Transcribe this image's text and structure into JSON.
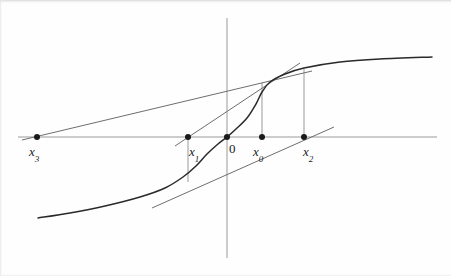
{
  "figure": {
    "background_color": "#fefefe",
    "curve_color": "#2a2a2a",
    "axis_color": "#9a9a9a",
    "tangent_color": "#6e6e6e",
    "point_color": "#1a1a1a"
  },
  "chart_data": {
    "type": "line",
    "title": "",
    "xlabel": "",
    "ylabel": "",
    "grid": false,
    "legend": null,
    "axes": {
      "origin_px": {
        "x": 227,
        "y": 137
      },
      "x_axis_px": {
        "x1": 18,
        "y1": 137,
        "x2": 437,
        "y2": 137
      },
      "y_axis_px": {
        "x1": 227,
        "y1": 18,
        "x2": 227,
        "y2": 258
      }
    },
    "curve": {
      "name": "f(x)",
      "description": "odd sigmoid-shaped function through the origin, flattening at both ends",
      "points_px": [
        {
          "x": 38,
          "y": 218
        },
        {
          "x": 70,
          "y": 213
        },
        {
          "x": 105,
          "y": 206
        },
        {
          "x": 140,
          "y": 197
        },
        {
          "x": 165,
          "y": 188
        },
        {
          "x": 183,
          "y": 177
        },
        {
          "x": 196,
          "y": 166
        },
        {
          "x": 207,
          "y": 154
        },
        {
          "x": 218,
          "y": 144
        },
        {
          "x": 227,
          "y": 137
        },
        {
          "x": 236,
          "y": 129
        },
        {
          "x": 247,
          "y": 118
        },
        {
          "x": 256,
          "y": 104
        },
        {
          "x": 262,
          "y": 92
        },
        {
          "x": 270,
          "y": 82
        },
        {
          "x": 285,
          "y": 74
        },
        {
          "x": 304,
          "y": 68
        },
        {
          "x": 340,
          "y": 62
        },
        {
          "x": 380,
          "y": 59
        },
        {
          "x": 432,
          "y": 57
        }
      ]
    },
    "points": [
      {
        "id": "x3",
        "label": "x",
        "subscript": "3",
        "x_px": 37,
        "y_px": 137,
        "label_x_px": 29,
        "label_y_px": 145
      },
      {
        "id": "x1",
        "label": "x",
        "subscript": "1",
        "x_px": 188,
        "y_px": 137,
        "label_x_px": 189,
        "label_y_px": 145
      },
      {
        "id": "origin",
        "label": "0",
        "subscript": "",
        "x_px": 227,
        "y_px": 137,
        "label_x_px": 229,
        "label_y_px": 142
      },
      {
        "id": "x0",
        "label": "x",
        "subscript": "0",
        "x_px": 262,
        "y_px": 137,
        "label_x_px": 253,
        "label_y_px": 145
      },
      {
        "id": "x2",
        "label": "x",
        "subscript": "2",
        "x_px": 304,
        "y_px": 137,
        "label_x_px": 303,
        "label_y_px": 145
      }
    ],
    "tangent_lines": [
      {
        "id": "tangent-at-x0",
        "touch_point_px": {
          "x": 262,
          "y": 82
        },
        "crosses_axis_at": "x1",
        "segment_px": {
          "x1": 175,
          "y1": 146,
          "x2": 300,
          "y2": 63
        }
      },
      {
        "id": "tangent-at-x1",
        "touch_point_px": {
          "x": 188,
          "y": 172
        },
        "crosses_axis_at": "x2",
        "segment_px": {
          "x1": 152,
          "y1": 208,
          "x2": 334,
          "y2": 127
        }
      },
      {
        "id": "tangent-at-x2",
        "touch_point_px": {
          "x": 304,
          "y": 68
        },
        "crosses_axis_at": "x3",
        "segment_px": {
          "x1": 22,
          "y1": 140,
          "x2": 312,
          "y2": 71
        }
      }
    ],
    "drop_lines": [
      {
        "id": "drop-x1",
        "x_px": 188,
        "y_top_px": 137,
        "y_bottom_px": 182
      },
      {
        "id": "drop-x0",
        "x_px": 262,
        "y_top_px": 83,
        "y_bottom_px": 137
      },
      {
        "id": "drop-x2",
        "x_px": 304,
        "y_top_px": 69,
        "y_bottom_px": 137
      }
    ]
  }
}
